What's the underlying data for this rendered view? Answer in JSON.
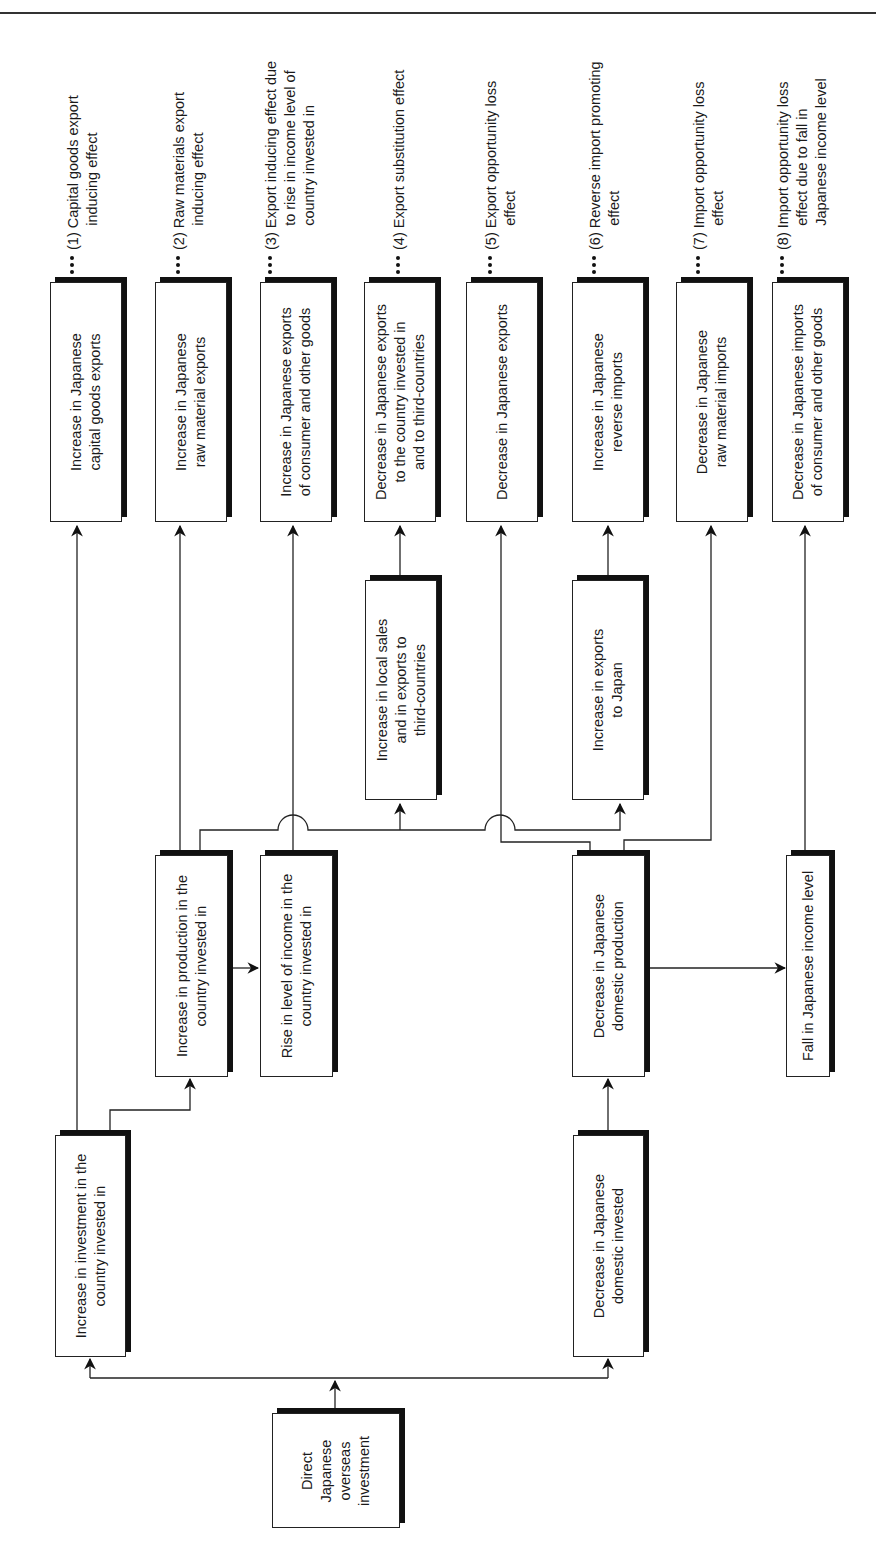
{
  "diagram": {
    "root": "Direct\nJapanese\noverseas\ninvestment",
    "branch_left": "Increase in investment in the\ncountry invested in",
    "branch_right": "Decrease in Japanese\ndomestic invested",
    "production_up": "Increase in production in the\ncountry invested in",
    "income_up": "Rise in level of income in the\ncountry invested in",
    "domestic_production_down": "Decrease in Japanese\ndomestic production",
    "japan_income_down": "Fall in Japanese income level",
    "local_sales_up": "Increase in local sales\nand in exports to\nthird-countries",
    "exports_to_japan_up": "Increase in exports\nto Japan",
    "outcomes": [
      {
        "box": "Increase in Japanese\ncapital goods exports",
        "effect_num": "(1)",
        "effect": "Capital goods export\n      inducing effect"
      },
      {
        "box": "Increase in Japanese\nraw material exports",
        "effect_num": "(2)",
        "effect": "Raw materials export\n      inducing effect"
      },
      {
        "box": "Increase in Japanese exports\nof consumer and other goods",
        "effect_num": "(3)",
        "effect": "Export inducing effect due\n      to rise in income level of\n      country invested in"
      },
      {
        "box": "Decrease in Japanese exports\nto the country invested in\nand to third-countries",
        "effect_num": "(4)",
        "effect": "Export substitution effect"
      },
      {
        "box": "Decrease in Japanese exports",
        "effect_num": "(5)",
        "effect": "Export opportunity loss\n      effect"
      },
      {
        "box": "Increase in Japanese\nreverse imports",
        "effect_num": "(6)",
        "effect": "Reverse import promoting\n      effect"
      },
      {
        "box": "Decrease in Japanese\nraw material imports",
        "effect_num": "(7)",
        "effect": "Import opportunity loss\n      effect"
      },
      {
        "box": "Decrease in Japanese imports\nof consumer and other goods",
        "effect_num": "(8)",
        "effect": "Import opportunity loss\n      effect due to fall in\n      Japanese income level"
      }
    ]
  },
  "colors": {
    "line": "#222222",
    "shadow": "#111111",
    "background": "#ffffff"
  }
}
